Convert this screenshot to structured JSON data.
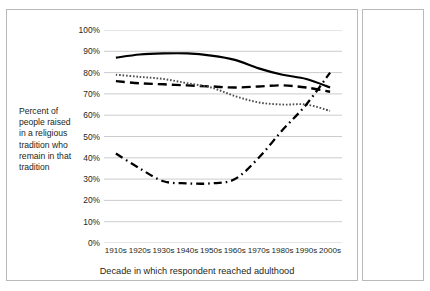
{
  "axis": {
    "y_title": "Percent of people raised in a religious tradition who remain in that tradition",
    "x_title": "Decade in which respondent reached adulthood",
    "yticks": [
      "100%",
      "90%",
      "80%",
      "70%",
      "60%",
      "50%",
      "40%",
      "30%",
      "20%",
      "10%",
      "0%"
    ]
  },
  "legend": {
    "items": [
      {
        "label": "Catholic",
        "style": "solid",
        "color": "#000000"
      },
      {
        "label": "Evangelical Protestant",
        "style": "dashed",
        "color": "#000000"
      },
      {
        "label": "Mainline Protestant",
        "style": "dotted",
        "color": "#4d4d4d"
      },
      {
        "label": "None",
        "style": "dashdot",
        "color": "#000000"
      }
    ]
  },
  "chart_data": {
    "type": "line",
    "title": "",
    "xlabel": "Decade in which respondent reached adulthood",
    "ylabel": "Percent of people raised in a religious tradition who remain in that tradition",
    "categories": [
      "1910s",
      "1920s",
      "1930s",
      "1940s",
      "1950s",
      "1960s",
      "1970s",
      "1980s",
      "1990s",
      "2000s"
    ],
    "ylim": [
      0,
      100
    ],
    "ytick_step": 10,
    "grid": "horizontal",
    "legend_position": "right",
    "series": [
      {
        "name": "Catholic",
        "style": "solid",
        "color": "#000000",
        "values": [
          87,
          88.5,
          89,
          89,
          88,
          86,
          82,
          79,
          77,
          73
        ]
      },
      {
        "name": "Evangelical Protestant",
        "style": "dashed",
        "color": "#000000",
        "values": [
          76,
          75,
          74.5,
          74,
          73.5,
          73,
          73.5,
          74,
          73,
          71
        ]
      },
      {
        "name": "Mainline Protestant",
        "style": "dotted",
        "color": "#4d4d4d",
        "values": [
          79,
          78,
          77,
          75,
          73,
          69,
          66,
          65,
          65,
          62
        ]
      },
      {
        "name": "None",
        "style": "dashdot",
        "color": "#000000",
        "values": [
          42,
          35,
          29,
          28,
          28,
          30,
          40,
          53,
          65,
          80
        ]
      }
    ]
  }
}
